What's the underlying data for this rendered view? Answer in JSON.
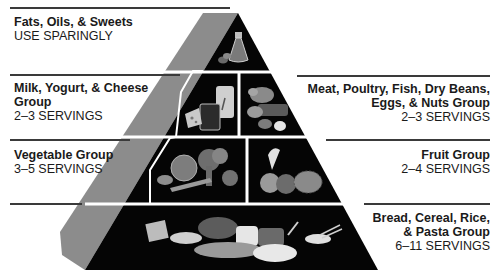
{
  "diagram": {
    "type": "food-guide-pyramid",
    "colors": {
      "tier_fill": "#050505",
      "side_face": "#8c8c8c",
      "divider": "#ffffff",
      "rule": "#3a3a3a",
      "text": "#1a1a1a"
    },
    "tiers": [
      {
        "level": 1,
        "position": "apex",
        "groups": [
          {
            "title": "Fats, Oils, & Sweets",
            "servings": "USE SPARINGLY",
            "side": "left",
            "icon": "oil-bottle-icon"
          }
        ]
      },
      {
        "level": 2,
        "groups": [
          {
            "title": "Milk, Yogurt, & Cheese Group",
            "title_line1": "Milk, Yogurt, & Cheese",
            "title_line2": "Group",
            "servings": "2–3 SERVINGS",
            "side": "left",
            "icon": "milk-cheese-icon"
          },
          {
            "title": "Meat, Poultry, Fish, Dry Beans, Eggs, & Nuts Group",
            "title_line1": "Meat, Poultry, Fish, Dry Beans,",
            "title_line2": "Eggs, & Nuts Group",
            "servings": "2–3 SERVINGS",
            "side": "right",
            "icon": "meat-poultry-icon"
          }
        ]
      },
      {
        "level": 3,
        "groups": [
          {
            "title": "Vegetable Group",
            "servings": "3–5 SERVINGS",
            "side": "left",
            "icon": "vegetables-icon"
          },
          {
            "title": "Fruit Group",
            "servings": "2–4 SERVINGS",
            "side": "right",
            "icon": "fruit-icon"
          }
        ]
      },
      {
        "level": 4,
        "position": "base",
        "groups": [
          {
            "title": "Bread, Cereal, Rice, & Pasta Group",
            "title_line1": "Bread, Cereal, Rice,",
            "title_line2": "& Pasta Group",
            "servings": "6–11 SERVINGS",
            "side": "right",
            "icon": "bread-grains-icon"
          }
        ]
      }
    ]
  }
}
